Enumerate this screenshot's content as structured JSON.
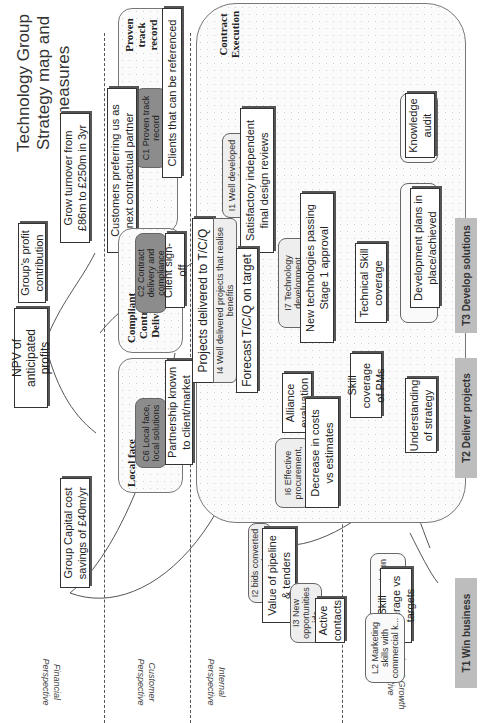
{
  "title": {
    "line1": "Technology Group",
    "line2": "Strategy map and measures"
  },
  "perspectives": [
    {
      "id": "financial",
      "label_line1": "Financial",
      "label_line2": "Perspective"
    },
    {
      "id": "customer",
      "label_line1": "Customer",
      "label_line2": "Perspective"
    },
    {
      "id": "internal",
      "label_line1": "Internal",
      "label_line2": "Perspective"
    },
    {
      "id": "learning",
      "label_line1": "Learning & Growth",
      "label_line2": "Perspective"
    }
  ],
  "financial": {
    "npv": "NPV of anticipated profits",
    "profit_contribution": "Group's profit contribution",
    "grow_turnover": "Grow turnover from £86m to £250m in 3yr",
    "capital_cost": "Group Capital cost savings of £40m/yr"
  },
  "customer": {
    "preferring": "Customers preferring us as next contractual partner",
    "groups": [
      {
        "label": "Proven track record",
        "objective": "C1 Proven track record",
        "measure": "Clients that can be referenced"
      },
      {
        "label": "Compliant Contract Delivery",
        "objective": "C2 Contract delivery and compliance",
        "measure": "Client sign-off"
      },
      {
        "label": "Local face",
        "objective": "C6 Local face, local solutions",
        "measure": "Partnership known to client/market"
      }
    ]
  },
  "internal": {
    "contract_execution_label": "Contract Execution",
    "objectives": [
      {
        "id": "I1",
        "text": "I1 Well developed appropriate te...",
        "measure": "Satisfactory independent final design reviews"
      },
      {
        "id": "I7",
        "text": "I7 Technology development",
        "measure": "New technologies passing Stage 1 approval"
      },
      {
        "id": "I4",
        "text": "I4 Well delivered projects that realise benefits",
        "measure_top": "Projects delivered to T/C/Q",
        "measure_bottom": "Forecast T/C/Q on target"
      },
      {
        "id": "I6",
        "text": "I6 Effective procurement,",
        "measure_top": "Alliance evaluation",
        "measure_bottom": "Decrease in costs vs estimates"
      },
      {
        "id": "I2",
        "text": "I2 bids converted to projects",
        "measure": "Value of pipeline & tenders"
      },
      {
        "id": "I3",
        "text": "I3 New opportunities ide...",
        "measure": "Active contacts"
      }
    ]
  },
  "learning": {
    "objectives": [
      {
        "id": "L?",
        "text": "...ive ...the ...s",
        "measure": "Knowledge audit"
      },
      {
        "id": "L4",
        "text": "L4 Per... focus ...tar...",
        "measure": "Development plans in place/achieved"
      },
      {
        "id": "tech",
        "measure": "Technical Skill coverage"
      },
      {
        "id": "pm",
        "measure": "Skill coverage of PMs"
      },
      {
        "id": "strategy",
        "measure": "Understanding of strategy"
      },
      {
        "id": "L7",
        "text": "L7 Negotiation & ...g skills",
        "measure": "Skill coverage vs targets"
      },
      {
        "id": "L2",
        "text": "L2 Marketing skills with commercial k..."
      }
    ]
  },
  "themes": [
    {
      "id": "T1",
      "label": "T1 Win business"
    },
    {
      "id": "T2",
      "label": "T2 Deliver projects"
    },
    {
      "id": "T3",
      "label": "T3 Develop solutions"
    }
  ]
}
